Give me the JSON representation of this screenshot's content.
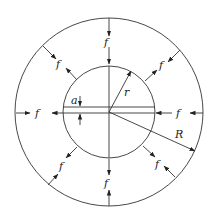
{
  "diagram": {
    "type": "annular ring under uniform radial pressure",
    "colors": {
      "stroke": "#333333",
      "text": "#222222",
      "background": "#ffffff"
    },
    "outer_circle": {
      "label": "R"
    },
    "inner_circle": {
      "label": "r"
    },
    "gap": {
      "label": "a"
    },
    "force_label": "f",
    "forces": [
      {
        "position": "top",
        "label": "f"
      },
      {
        "position": "top-right",
        "label": "f"
      },
      {
        "position": "right",
        "label": "f"
      },
      {
        "position": "bottom-right",
        "label": "f"
      },
      {
        "position": "bottom",
        "label": "f"
      },
      {
        "position": "bottom-left",
        "label": "f"
      },
      {
        "position": "left",
        "label": "f"
      },
      {
        "position": "top-left",
        "label": "f"
      }
    ]
  }
}
